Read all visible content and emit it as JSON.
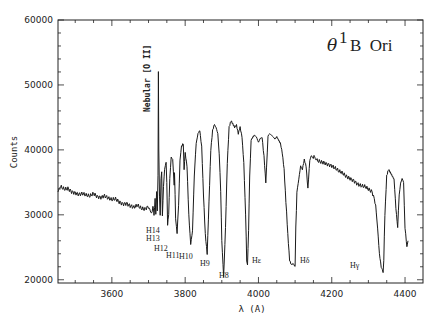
{
  "chart_data": {
    "type": "line",
    "title_parts": {
      "symbol": "θ",
      "superscript": "1",
      "rest": "B  Ori"
    },
    "xlabel": "λ (A)",
    "ylabel": "Counts",
    "xlim": [
      3453,
      4449
    ],
    "ylim": [
      19500,
      60000
    ],
    "xticks": [
      3600,
      3800,
      4000,
      4200,
      4400
    ],
    "xtick_labels": [
      "3600",
      "3800",
      "4000",
      "4200",
      "4400"
    ],
    "yticks": [
      20000,
      30000,
      40000,
      50000,
      60000
    ],
    "ytick_labels": [
      "20000",
      "30000",
      "40000",
      "50000",
      "60000"
    ],
    "grid": false,
    "legend": null,
    "series": [
      {
        "name": "θ1 B Ori spectrum",
        "x": [
          3453,
          3460,
          3470,
          3480,
          3490,
          3500,
          3510,
          3520,
          3530,
          3540,
          3550,
          3560,
          3570,
          3580,
          3590,
          3600,
          3610,
          3620,
          3630,
          3640,
          3650,
          3660,
          3670,
          3680,
          3690,
          3700,
          3705,
          3710,
          3712,
          3715,
          3718,
          3720,
          3722,
          3724,
          3726,
          3727,
          3728,
          3730,
          3732,
          3734,
          3736,
          3738,
          3741,
          3744,
          3748,
          3750,
          3752,
          3755,
          3758,
          3762,
          3766,
          3770,
          3771,
          3774,
          3778,
          3782,
          3786,
          3790,
          3795,
          3797,
          3800,
          3805,
          3810,
          3815,
          3820,
          3825,
          3830,
          3835,
          3840,
          3845,
          3850,
          3855,
          3860,
          3865,
          3870,
          3875,
          3880,
          3884,
          3889,
          3893,
          3897,
          3900,
          3905,
          3910,
          3915,
          3920,
          3925,
          3930,
          3935,
          3940,
          3945,
          3950,
          3955,
          3960,
          3965,
          3968,
          3970,
          3973,
          3976,
          3980,
          3985,
          3990,
          4000,
          4010,
          4015,
          4020,
          4026,
          4030,
          4035,
          4040,
          4045,
          4050,
          4055,
          4060,
          4065,
          4070,
          4075,
          4080,
          4085,
          4090,
          4095,
          4100,
          4102,
          4105,
          4110,
          4115,
          4120,
          4125,
          4130,
          4135,
          4140,
          4144,
          4148,
          4155,
          4160,
          4170,
          4180,
          4190,
          4200,
          4210,
          4220,
          4230,
          4240,
          4250,
          4260,
          4270,
          4280,
          4290,
          4300,
          4310,
          4320,
          4325,
          4330,
          4335,
          4338,
          4340,
          4342,
          4345,
          4350,
          4355,
          4360,
          4365,
          4370,
          4375,
          4380,
          4384,
          4388,
          4392,
          4396,
          4400,
          4405,
          4408
        ],
        "y": [
          34000,
          34200,
          33900,
          34100,
          33700,
          33600,
          33400,
          33500,
          33200,
          33000,
          33300,
          32700,
          32500,
          32700,
          32300,
          32100,
          32300,
          31900,
          31700,
          31900,
          31600,
          31400,
          31700,
          31200,
          31000,
          31300,
          30800,
          30200,
          31500,
          29800,
          32600,
          30200,
          33600,
          30500,
          36000,
          52000,
          40000,
          33000,
          30000,
          35500,
          36500,
          29800,
          34500,
          37000,
          38000,
          35000,
          28500,
          30000,
          35500,
          39000,
          38500,
          34500,
          36500,
          29500,
          27000,
          31500,
          38500,
          40500,
          41000,
          37000,
          39500,
          37500,
          30000,
          25500,
          27500,
          36000,
          41000,
          42500,
          43000,
          40500,
          33000,
          27000,
          24000,
          32000,
          40000,
          43000,
          44000,
          43500,
          42500,
          39500,
          33500,
          26000,
          20500,
          28000,
          38000,
          43500,
          44500,
          44000,
          43500,
          43800,
          42500,
          43500,
          42000,
          38000,
          30000,
          23000,
          22300,
          27500,
          36000,
          41500,
          42000,
          42300,
          41300,
          42000,
          39000,
          35000,
          42000,
          42500,
          42300,
          42000,
          41700,
          42000,
          41500,
          41000,
          39500,
          37000,
          32000,
          27000,
          23000,
          22300,
          22500,
          22000,
          28000,
          33500,
          35500,
          37500,
          37000,
          38500,
          37500,
          34000,
          38500,
          39000,
          38800,
          38500,
          38300,
          38000,
          37800,
          37500,
          37300,
          37000,
          36600,
          36400,
          36000,
          35800,
          35500,
          35000,
          34700,
          34500,
          34000,
          33500,
          31500,
          28000,
          24000,
          22000,
          21500,
          21000,
          23000,
          30000,
          36000,
          37000,
          36500,
          36000,
          35500,
          31000,
          28000,
          33000,
          35000,
          35500,
          35000,
          28000,
          25000,
          26000
        ],
        "color": "#1a1a1a"
      }
    ],
    "annotations": [
      {
        "text": "Nebular [O II]",
        "x": 3727,
        "y": 52000,
        "rotation": -90
      },
      {
        "text": "H14",
        "x": 3721
      },
      {
        "text": "H13",
        "x": 3734
      },
      {
        "text": "H12",
        "x": 3750
      },
      {
        "text": "H11",
        "x": 3771
      },
      {
        "text": "H10",
        "x": 3798
      },
      {
        "text": "H9",
        "x": 3835
      },
      {
        "text": "H8",
        "x": 3889
      },
      {
        "text": "Hε",
        "x": 3970
      },
      {
        "text": "Hδ",
        "x": 4102
      },
      {
        "text": "Hγ",
        "x": 4340
      }
    ]
  }
}
